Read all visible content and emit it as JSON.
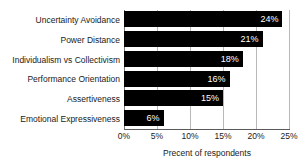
{
  "chart_data": {
    "type": "bar",
    "orientation": "horizontal",
    "title": "",
    "xlabel": "Precent of respondents",
    "ylabel": "",
    "categories": [
      "Uncertainty Avoidance",
      "Power Distance",
      "Individualism vs Collectivism",
      "Performance Orientation",
      "Assertiveness",
      "Emotional Expressiveness"
    ],
    "values": [
      24,
      21,
      18,
      16,
      15,
      6
    ],
    "data_labels": [
      "24%",
      "21%",
      "18%",
      "16%",
      "15%",
      "6%"
    ],
    "xlim": [
      0,
      25
    ],
    "xticks": [
      0,
      5,
      10,
      15,
      20,
      25
    ],
    "xtick_labels": [
      "0%",
      "5%",
      "10%",
      "15%",
      "20%",
      "25%"
    ],
    "grid": "vertical",
    "legend": "none",
    "bar_color": "#000000",
    "label_color": "#ffffff",
    "gridline_color": "#b8b8b8",
    "background_color": "#ffffff"
  }
}
